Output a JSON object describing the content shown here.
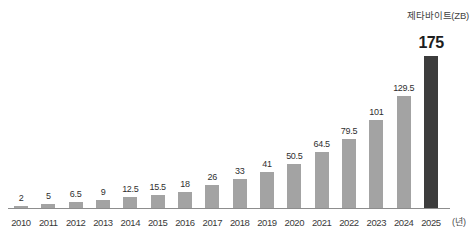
{
  "chart_data": {
    "type": "bar",
    "title": "",
    "unit_caption": "제타바이트(ZB)",
    "xlabel": "(년)",
    "ylabel": "",
    "grid": false,
    "legend": "none",
    "ylim": [
      0,
      175
    ],
    "categories": [
      "2010",
      "2011",
      "2012",
      "2013",
      "2014",
      "2015",
      "2016",
      "2017",
      "2018",
      "2019",
      "2020",
      "2021",
      "2022",
      "2023",
      "2024",
      "2025"
    ],
    "values": [
      2,
      5,
      6.5,
      9,
      12.5,
      15.5,
      18,
      26,
      33,
      41,
      50.5,
      64.5,
      79.5,
      101,
      129.5,
      175
    ],
    "value_labels": [
      "2",
      "5",
      "6.5",
      "9",
      "12.5",
      "15.5",
      "18",
      "26",
      "33",
      "41",
      "50.5",
      "64.5",
      "79.5",
      "101",
      "129.5",
      "175"
    ],
    "highlight_index": 15,
    "colors": {
      "bar": "#a3a3a3",
      "bar_highlight": "#3c3c3c",
      "axis": "#8d8d8d",
      "text": "#3a3a3a"
    }
  }
}
